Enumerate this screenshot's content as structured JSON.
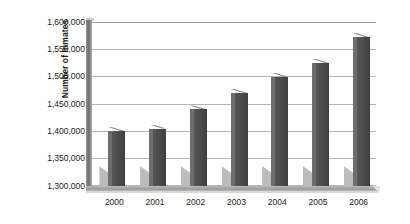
{
  "chart_data": {
    "type": "bar",
    "title": "",
    "xlabel": "",
    "ylabel": "Number of Inmates",
    "categories": [
      "2000",
      "2001",
      "2002",
      "2003",
      "2004",
      "2005",
      "2006"
    ],
    "values": [
      1400000,
      1405000,
      1440000,
      1470000,
      1500000,
      1525000,
      1572000
    ],
    "ylim": [
      1300000,
      1600000
    ],
    "ytick_values": [
      1300000,
      1350000,
      1400000,
      1450000,
      1500000,
      1550000,
      1600000
    ],
    "ytick_labels": [
      "1,600,000",
      "1,550,000",
      "1,500,000",
      "1,450,000",
      "1,400,000",
      "1,350,000",
      "1,300,000"
    ],
    "grid": true,
    "legend": "none",
    "series": [
      {
        "name": "Number of Inmates",
        "color": "#4b4b4b",
        "values": [
          1400000,
          1405000,
          1440000,
          1470000,
          1500000,
          1525000,
          1572000
        ]
      }
    ],
    "style": {
      "bar_color": "#4b4b4b",
      "gridline_color": "#b4b4b4",
      "axis_wall_color": "#6f6f6f",
      "floor_color": "#9c9c9c",
      "background": "#ffffff",
      "text_color": "#1a1a1a"
    }
  }
}
